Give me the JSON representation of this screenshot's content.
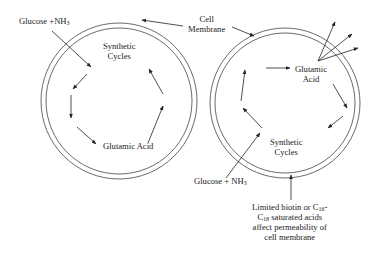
{
  "diagram": {
    "left_cell": {
      "input_label": "Glucose +NH",
      "input_sub": "3",
      "cycle_label_line1": "Synthetic",
      "cycle_label_line2": "Cycles",
      "product_label": "Glutamic Acid"
    },
    "membrane_label_line1": "Cell",
    "membrane_label_line2": "Membrane",
    "right_cell": {
      "product_label_line1": "Glutamic",
      "product_label_line2": "Acid",
      "cycle_label_line1": "Synthetic",
      "cycle_label_line2": "Cycles",
      "input_label": "Glucose + NH",
      "input_sub": "3"
    },
    "note": {
      "line1_a": "Limited biotin or C",
      "line1_sub": "16",
      "line1_b": "-",
      "line2_a": "C",
      "line2_sub": "18",
      "line2_b": " saturated acids",
      "line3": "affect permeability of",
      "line4": "cell membrane"
    },
    "colors": {
      "stroke": "#333333",
      "text": "#222222",
      "background": "#ffffff"
    }
  }
}
